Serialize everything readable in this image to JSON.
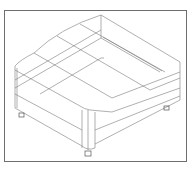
{
  "drawing": {
    "subject": "ottoman-wireframe",
    "style": "isometric line drawing",
    "frame_color": "#6e6e6e",
    "line_color": "#7a7a7a",
    "background": "#ffffff"
  }
}
